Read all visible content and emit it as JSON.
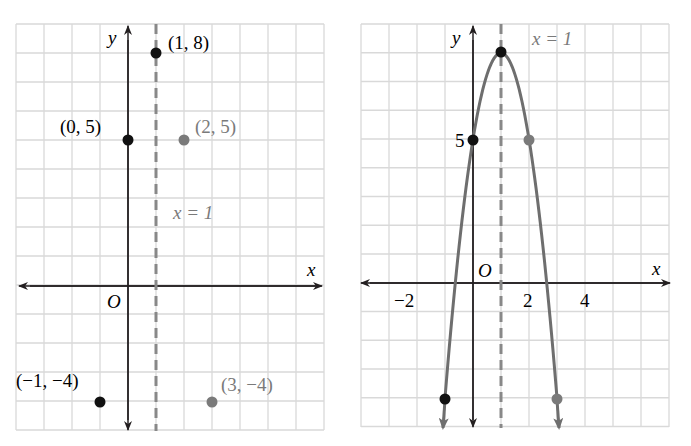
{
  "colors": {
    "grid": "#d9d9d9",
    "axis": "#231f20",
    "black_point": "#111111",
    "gray": "#7a7a7a",
    "curve": "#6e6e6e"
  },
  "left_graph": {
    "axis_x_label": "x",
    "axis_y_label": "y",
    "origin_label": "O",
    "axis_of_symmetry_label": "x = 1",
    "points": [
      {
        "label": "(1, 8)",
        "x": 1,
        "y": 8,
        "color": "black"
      },
      {
        "label": "(0, 5)",
        "x": 0,
        "y": 5,
        "color": "black"
      },
      {
        "label": "(2, 5)",
        "x": 2,
        "y": 5,
        "color": "gray"
      },
      {
        "label": "(−1, −4)",
        "x": -1,
        "y": -4,
        "color": "black"
      },
      {
        "label": "(3, −4)",
        "x": 3,
        "y": -4,
        "color": "gray"
      }
    ]
  },
  "right_graph": {
    "axis_x_label": "x",
    "axis_y_label": "y",
    "origin_label": "O",
    "axis_of_symmetry_label": "x = 1",
    "y_tick_label": "5",
    "x_tick_labels": [
      "−2",
      "2",
      "4"
    ]
  },
  "chart_data": [
    {
      "type": "scatter",
      "title": "",
      "xlabel": "x",
      "ylabel": "y",
      "xlim": [
        -4,
        7
      ],
      "ylim": [
        -5,
        9
      ],
      "grid": true,
      "series": [
        {
          "name": "points",
          "x": [
            1,
            0,
            2,
            -1,
            3
          ],
          "y": [
            8,
            5,
            5,
            -4,
            -4
          ],
          "labels": [
            "(1, 8)",
            "(0, 5)",
            "(2, 5)",
            "(−1, −4)",
            "(3, −4)"
          ]
        }
      ],
      "annotations": [
        "x = 1 (dashed axis of symmetry)",
        "O"
      ]
    },
    {
      "type": "line",
      "title": "",
      "xlabel": "x",
      "ylabel": "y",
      "xlim": [
        -4,
        7
      ],
      "ylim": [
        -5,
        9
      ],
      "grid": true,
      "function": "y = -3(x-1)^2 + 8",
      "series": [
        {
          "name": "parabola",
          "x": [
            -1,
            0,
            1,
            2,
            3
          ],
          "y": [
            -4,
            5,
            8,
            5,
            -4
          ]
        }
      ],
      "x_ticks": [
        -2,
        2,
        4
      ],
      "y_ticks": [
        5
      ],
      "annotations": [
        "x = 1 (dashed axis of symmetry)",
        "O"
      ]
    }
  ]
}
